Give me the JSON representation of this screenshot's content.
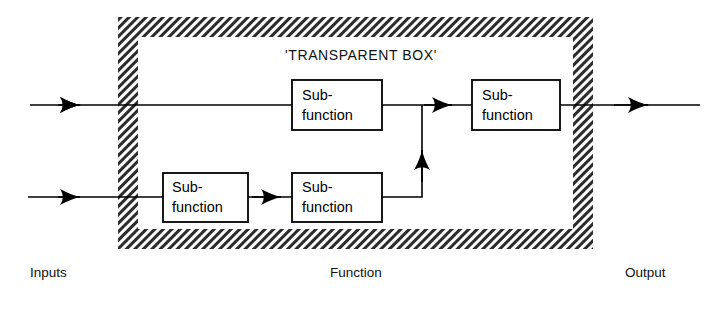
{
  "diagram": {
    "title": "'TRANSPARENT BOX'",
    "frame": {
      "style": "diagonal-hatch",
      "color": "#2b2b2b",
      "outer": {
        "x": 118,
        "y": 17,
        "width": 475,
        "height": 232
      },
      "inner": {
        "x": 138,
        "y": 37,
        "width": 435,
        "height": 192
      }
    },
    "blocks": [
      {
        "id": "top-middle",
        "line1": "Sub-",
        "line2": "function",
        "x": 292,
        "y": 80,
        "width": 90,
        "height": 50
      },
      {
        "id": "top-right",
        "line1": "Sub-",
        "line2": "function",
        "x": 472,
        "y": 80,
        "width": 88,
        "height": 50
      },
      {
        "id": "bottom-left",
        "line1": "Sub-",
        "line2": "function",
        "x": 163,
        "y": 173,
        "width": 85,
        "height": 49
      },
      {
        "id": "bottom-middle",
        "line1": "Sub-",
        "line2": "function",
        "x": 292,
        "y": 173,
        "width": 90,
        "height": 49
      }
    ],
    "captions": {
      "inputs": "Inputs",
      "function": "Function",
      "output": "Output"
    },
    "colors": {
      "line": "#000000",
      "text": "#000000",
      "background": "#ffffff",
      "hatch": "#2b2b2b"
    }
  }
}
